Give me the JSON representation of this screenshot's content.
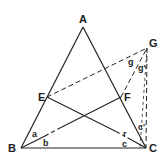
{
  "diagram": {
    "points": {
      "A": {
        "label": "A",
        "x": 83,
        "y": 27
      },
      "B": {
        "label": "B",
        "x": 21,
        "y": 148
      },
      "C": {
        "label": "C",
        "x": 146,
        "y": 148
      },
      "E": {
        "label": "E",
        "x": 47,
        "y": 97
      },
      "F": {
        "label": "F",
        "x": 121,
        "y": 97
      },
      "G": {
        "label": "G",
        "x": 147,
        "y": 48
      }
    },
    "solid_segments": [
      "AB",
      "AC",
      "BC",
      "BF",
      "EC"
    ],
    "dashed_segments": [
      "EG",
      "FG",
      "GC",
      "BF-dash",
      "EC-dash"
    ],
    "angle_labels": {
      "a": "a",
      "b": "b",
      "c": "c",
      "c_prime": "c'",
      "r": "r",
      "g": "g",
      "g_prime": "g'"
    }
  }
}
